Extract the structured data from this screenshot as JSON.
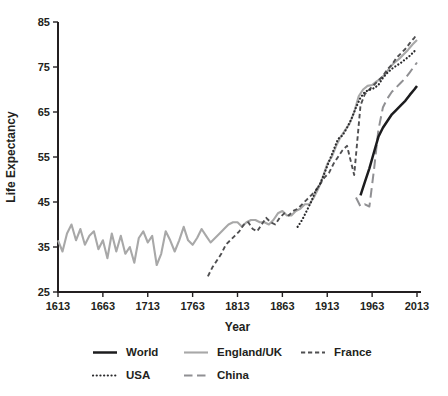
{
  "chart_data": {
    "type": "line",
    "title": "",
    "xlabel": "Year",
    "ylabel": "Life Expectancy",
    "axes": {
      "color": "#231f20",
      "xlim": [
        1613,
        2013
      ],
      "ylim": [
        25,
        85
      ],
      "xticks": [
        1613,
        1663,
        1713,
        1763,
        1813,
        1863,
        1913,
        1963,
        2013
      ],
      "yticks": [
        25,
        35,
        45,
        55,
        65,
        75,
        85
      ],
      "grid": false,
      "plot": {
        "left": 58,
        "right": 417,
        "top": 22,
        "bottom": 292
      }
    },
    "legend_position": "bottom",
    "series": [
      {
        "id": "england",
        "name": "England/UK",
        "color": "#a8a8a8",
        "width": 2.1,
        "dash": "",
        "legend_dash": "",
        "points": [
          [
            1613,
            36.5
          ],
          [
            1618,
            34
          ],
          [
            1623,
            38
          ],
          [
            1628,
            40
          ],
          [
            1633,
            36.5
          ],
          [
            1638,
            39
          ],
          [
            1643,
            35.5
          ],
          [
            1648,
            37.5
          ],
          [
            1653,
            38.5
          ],
          [
            1658,
            34.5
          ],
          [
            1663,
            36.5
          ],
          [
            1668,
            32.5
          ],
          [
            1673,
            38
          ],
          [
            1678,
            34
          ],
          [
            1683,
            37.5
          ],
          [
            1688,
            33.5
          ],
          [
            1693,
            35
          ],
          [
            1698,
            31.5
          ],
          [
            1703,
            37
          ],
          [
            1708,
            38.5
          ],
          [
            1713,
            36
          ],
          [
            1718,
            37.5
          ],
          [
            1723,
            31
          ],
          [
            1728,
            33.5
          ],
          [
            1733,
            38.5
          ],
          [
            1738,
            36.5
          ],
          [
            1743,
            34
          ],
          [
            1748,
            36.5
          ],
          [
            1753,
            39.5
          ],
          [
            1758,
            36.5
          ],
          [
            1763,
            35.5
          ],
          [
            1768,
            37
          ],
          [
            1773,
            39
          ],
          [
            1778,
            37.5
          ],
          [
            1783,
            36
          ],
          [
            1788,
            37
          ],
          [
            1793,
            38
          ],
          [
            1798,
            39
          ],
          [
            1803,
            40
          ],
          [
            1808,
            40.5
          ],
          [
            1813,
            40.5
          ],
          [
            1818,
            39.5
          ],
          [
            1823,
            40.5
          ],
          [
            1828,
            41
          ],
          [
            1833,
            41
          ],
          [
            1838,
            40.5
          ],
          [
            1843,
            40.5
          ],
          [
            1848,
            40
          ],
          [
            1853,
            41
          ],
          [
            1858,
            42.5
          ],
          [
            1863,
            43
          ],
          [
            1868,
            42
          ],
          [
            1873,
            42
          ],
          [
            1878,
            43
          ],
          [
            1883,
            43.5
          ],
          [
            1888,
            44.5
          ],
          [
            1893,
            44.5
          ],
          [
            1898,
            46
          ],
          [
            1903,
            48
          ],
          [
            1908,
            50.5
          ],
          [
            1913,
            53.5
          ],
          [
            1918,
            55
          ],
          [
            1923,
            57.5
          ],
          [
            1928,
            59.5
          ],
          [
            1933,
            61
          ],
          [
            1938,
            62.5
          ],
          [
            1943,
            65
          ],
          [
            1948,
            68.5
          ],
          [
            1953,
            70
          ],
          [
            1958,
            70.8
          ],
          [
            1963,
            71
          ],
          [
            1968,
            71.8
          ],
          [
            1973,
            72.5
          ],
          [
            1978,
            73.5
          ],
          [
            1983,
            75
          ],
          [
            1988,
            76
          ],
          [
            1993,
            76.8
          ],
          [
            1998,
            77.8
          ],
          [
            2003,
            78.8
          ],
          [
            2008,
            80
          ],
          [
            2013,
            81
          ]
        ]
      },
      {
        "id": "france",
        "name": "France",
        "color": "#4f4f51",
        "width": 1.9,
        "dash": "4.5 3",
        "legend_dash": "4.2 2.8",
        "points": [
          [
            1780,
            28.5
          ],
          [
            1785,
            30.5
          ],
          [
            1790,
            32
          ],
          [
            1795,
            33.5
          ],
          [
            1800,
            35.5
          ],
          [
            1805,
            36.5
          ],
          [
            1810,
            37.5
          ],
          [
            1815,
            38.5
          ],
          [
            1820,
            40
          ],
          [
            1825,
            40.5
          ],
          [
            1830,
            39
          ],
          [
            1835,
            38.5
          ],
          [
            1840,
            40
          ],
          [
            1845,
            41.5
          ],
          [
            1850,
            40.5
          ],
          [
            1855,
            40
          ],
          [
            1860,
            41.5
          ],
          [
            1865,
            42.5
          ],
          [
            1870,
            42
          ],
          [
            1875,
            43
          ],
          [
            1880,
            43.5
          ],
          [
            1885,
            44.5
          ],
          [
            1890,
            45.5
          ],
          [
            1895,
            46.5
          ],
          [
            1900,
            47.5
          ],
          [
            1905,
            49
          ],
          [
            1910,
            50.5
          ],
          [
            1915,
            51.5
          ],
          [
            1920,
            53.5
          ],
          [
            1925,
            55
          ],
          [
            1930,
            56.5
          ],
          [
            1935,
            57.5
          ],
          [
            1943,
            51
          ],
          [
            1950,
            66.5
          ],
          [
            1955,
            69
          ],
          [
            1960,
            70
          ],
          [
            1965,
            71
          ],
          [
            1970,
            72
          ],
          [
            1975,
            73
          ],
          [
            1980,
            74.5
          ],
          [
            1985,
            75.5
          ],
          [
            1990,
            77
          ],
          [
            1995,
            78
          ],
          [
            2000,
            79
          ],
          [
            2005,
            80.3
          ],
          [
            2010,
            81.5
          ],
          [
            2013,
            82.3
          ]
        ]
      },
      {
        "id": "usa",
        "name": "USA",
        "color": "#2a2a2c",
        "width": 2.2,
        "dash": "0.1 3.4",
        "linecap": "round",
        "legend_dash": "0.1 3.6",
        "points": [
          [
            1880,
            39.5
          ],
          [
            1885,
            41
          ],
          [
            1890,
            43
          ],
          [
            1895,
            45
          ],
          [
            1900,
            47.5
          ],
          [
            1905,
            49
          ],
          [
            1910,
            51.5
          ],
          [
            1915,
            54
          ],
          [
            1920,
            56.5
          ],
          [
            1925,
            59
          ],
          [
            1930,
            59.8
          ],
          [
            1935,
            61.5
          ],
          [
            1940,
            63.5
          ],
          [
            1945,
            66
          ],
          [
            1950,
            68.2
          ],
          [
            1955,
            69.5
          ],
          [
            1960,
            69.9
          ],
          [
            1965,
            70.3
          ],
          [
            1970,
            71
          ],
          [
            1975,
            72.6
          ],
          [
            1980,
            73.7
          ],
          [
            1985,
            74.6
          ],
          [
            1990,
            75.3
          ],
          [
            1995,
            75.9
          ],
          [
            2000,
            76.7
          ],
          [
            2005,
            77.5
          ],
          [
            2010,
            78.5
          ],
          [
            2013,
            78.9
          ]
        ]
      },
      {
        "id": "china",
        "name": "China",
        "color": "#909093",
        "width": 2,
        "dash": "9.5 5",
        "legend_dash": "8.5 4.5",
        "points": [
          [
            1945,
            46
          ],
          [
            1950,
            44
          ],
          [
            1955,
            44.5
          ],
          [
            1960,
            44
          ],
          [
            1965,
            52
          ],
          [
            1970,
            61
          ],
          [
            1975,
            66
          ],
          [
            1980,
            68
          ],
          [
            1985,
            69.5
          ],
          [
            1990,
            70.5
          ],
          [
            1995,
            71.5
          ],
          [
            2000,
            72.5
          ],
          [
            2005,
            73.8
          ],
          [
            2010,
            75.2
          ],
          [
            2013,
            76
          ]
        ]
      },
      {
        "id": "world",
        "name": "World",
        "color": "#1c1c1e",
        "width": 2.5,
        "dash": "",
        "legend_dash": "",
        "points": [
          [
            1950,
            46.5
          ],
          [
            1955,
            49.5
          ],
          [
            1960,
            52.5
          ],
          [
            1965,
            56
          ],
          [
            1970,
            59.5
          ],
          [
            1975,
            61.5
          ],
          [
            1980,
            63
          ],
          [
            1985,
            64.5
          ],
          [
            1990,
            65.5
          ],
          [
            1995,
            66.5
          ],
          [
            2000,
            67.5
          ],
          [
            2005,
            68.8
          ],
          [
            2010,
            70
          ],
          [
            2013,
            70.8
          ]
        ]
      }
    ]
  },
  "legend": {
    "rows": [
      [
        "world",
        "england",
        "france"
      ],
      [
        "usa",
        "china"
      ]
    ]
  }
}
